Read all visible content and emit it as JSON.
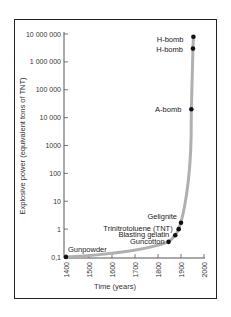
{
  "chart_data": {
    "type": "line",
    "title": "",
    "xlabel": "Time (years)",
    "ylabel": "Explosive power (equivalent tons of TNT)",
    "yscale": "log",
    "xlim": [
      1400,
      2000
    ],
    "ylim": [
      0.1,
      10000000
    ],
    "grid": false,
    "legend": null,
    "x_ticks": [
      "1400",
      "1500",
      "1600",
      "1700",
      "1800",
      "1900",
      "2000"
    ],
    "y_ticks": [
      "0,1",
      "1",
      "10",
      "100",
      "1000",
      "10 000",
      "100 000",
      "1 000 000",
      "10 000 000"
    ],
    "curve_color": "#b0b0b0",
    "point_color": "#111111",
    "points": [
      {
        "label": "Gunpowder",
        "x": 1400,
        "y": 0.1
      },
      {
        "label": "Guncotton",
        "x": 1846,
        "y": 0.35
      },
      {
        "label": "Blasting gelatin",
        "x": 1875,
        "y": 0.6
      },
      {
        "label": "Trinitrotoluene (TNT)",
        "x": 1890,
        "y": 1.0
      },
      {
        "label": "Gelignite",
        "x": 1900,
        "y": 1.7
      },
      {
        "label": "A-bomb",
        "x": 1945,
        "y": 20000
      },
      {
        "label": "H-bomb",
        "x": 1952,
        "y": 3000000
      },
      {
        "label": "H-bomb",
        "x": 1954,
        "y": 8000000
      }
    ]
  }
}
